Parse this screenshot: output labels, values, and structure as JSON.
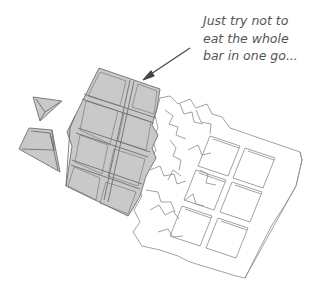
{
  "caption": {
    "lines": [
      "Just try not to",
      "eat the whole",
      "bar in one go..."
    ]
  },
  "illustration": {
    "subject": "chocolate-bar-partially-unwrapped",
    "icons": [
      "arrow-icon",
      "chocolate-piece-icon",
      "foil-wrapper-icon"
    ],
    "colors": {
      "chocolate_fill": "#c9c9c9",
      "chocolate_stroke": "#6f6f6f",
      "wrapper_fill": "#ffffff",
      "wrapper_stroke": "#8a8a8a",
      "arrow": "#444444",
      "caption_text": "#555555"
    }
  }
}
